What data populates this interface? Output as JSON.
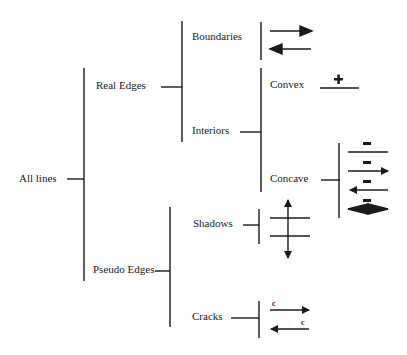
{
  "diagram": {
    "root": {
      "label": "All lines"
    },
    "nodes": {
      "real_edges": "Real Edges",
      "pseudo_edges": "Pseudo Edges",
      "boundaries": "Boundaries",
      "interiors": "Interiors",
      "convex": "Convex",
      "concave": "Concave",
      "shadows": "Shadows",
      "cracks": "Cracks"
    },
    "symbols": {
      "convex": "+",
      "concave_mark": "−",
      "crack_mark": "c"
    },
    "ink_color": "#1a1a1a"
  }
}
